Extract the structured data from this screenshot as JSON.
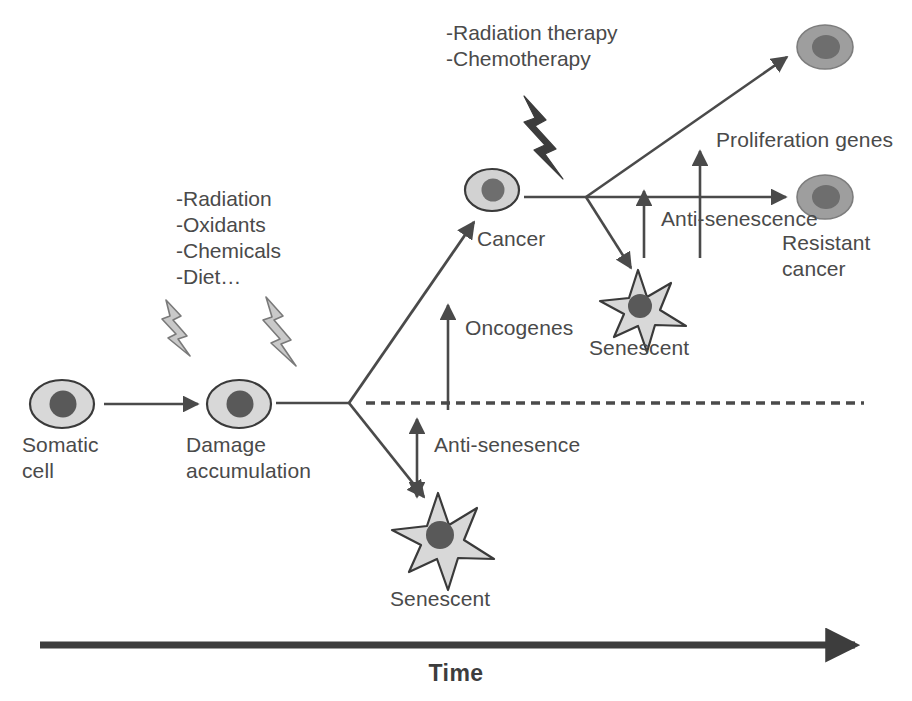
{
  "figure": {
    "domain": "diagram",
    "kind": "biological-pathway-schematic",
    "background_color": "#ffffff",
    "text_color": "#4a4a4a"
  },
  "palette": {
    "cell_body": "#d8d8d8",
    "cell_outline": "#3a3a3a",
    "nucleus": "#595959",
    "cancer_body": "#9e9e9e",
    "cancer_nucleus": "#6e6e6e",
    "bolt_light": "#c9c9c9",
    "bolt_light_outline": "#7a7a7a",
    "bolt_dark": "#3c3c3c",
    "arrow": "#4a4a4a",
    "axis": "#3d3d3d",
    "dashed_line": "#4a4a4a"
  },
  "stressors": {
    "early": {
      "name": "damage-stressors",
      "lines": [
        "-Radiation",
        "-Oxidants",
        "-Chemicals",
        "-Diet…"
      ],
      "text": "-Radiation\n-Oxidants\n-Chemicals\n-Diet…"
    },
    "therapy": {
      "name": "therapy-stressors",
      "lines": [
        "-Radiation therapy",
        "-Chemotherapy"
      ],
      "text": "-Radiation therapy\n-Chemotherapy"
    }
  },
  "cells": {
    "somatic": {
      "label": "Somatic\ncell",
      "label_line1": "Somatic",
      "label_line2": "cell",
      "type": "round"
    },
    "damage": {
      "label": "Damage\naccumulation",
      "label_line1": "Damage",
      "label_line2": "accumulation",
      "type": "round"
    },
    "cancer": {
      "label": "Cancer",
      "type": "round"
    },
    "senescent_lower": {
      "label": "Senescent",
      "type": "star"
    },
    "senescent_upper": {
      "label": "Senescent",
      "type": "star"
    },
    "resistant_cancer": {
      "label": "Resistant\ncancer",
      "label_line1": "Resistant",
      "label_line2": "cancer",
      "type": "round"
    }
  },
  "annotations": {
    "oncogenes": "Oncogenes",
    "anti_senesence_lower": "Anti-senesence",
    "anti_senescence_upper": "Anti-senescence",
    "proliferation_genes": "Proliferation genes"
  },
  "axis": {
    "title": "Time",
    "direction": "left-to-right"
  }
}
